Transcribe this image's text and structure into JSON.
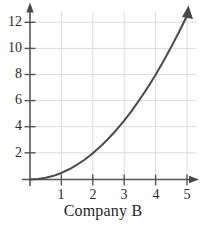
{
  "figure": {
    "caption": "Company B",
    "background_color": "#ffffff"
  },
  "chart_data": {
    "type": "line",
    "title": "",
    "subtitle": "",
    "xlabel": "Company B",
    "ylabel": "",
    "xlim": [
      0,
      5.4
    ],
    "ylim": [
      0,
      13.0
    ],
    "grid": true,
    "legend": null,
    "curve_color": "#4a4a4a",
    "axis_color": "#555555",
    "grid_color": "#d9d9d9",
    "xticks": [
      1,
      2,
      3,
      4,
      5
    ],
    "xtick_labels": [
      "1",
      "2",
      "3",
      "4",
      "5"
    ],
    "yticks": [
      2,
      4,
      6,
      8,
      10,
      12
    ],
    "ytick_labels": [
      "2",
      "4",
      "6",
      "8",
      "10",
      "12"
    ],
    "annotations": [
      "x-axis arrowhead at right end",
      "y-axis arrowhead at top end",
      "curve arrowhead at upper right end"
    ],
    "relationship": "y = 0.5 * x^2",
    "x": [
      0,
      0.25,
      0.5,
      0.75,
      1,
      1.25,
      1.5,
      1.75,
      2,
      2.25,
      2.5,
      2.75,
      3,
      3.25,
      3.5,
      3.75,
      4,
      4.25,
      4.5,
      4.75,
      5
    ],
    "series": [
      {
        "name": "Company B",
        "values": [
          0,
          0.03,
          0.13,
          0.28,
          0.5,
          0.78,
          1.13,
          1.53,
          2,
          2.53,
          3.13,
          3.78,
          4.5,
          5.28,
          6.13,
          7.03,
          8,
          9.03,
          10.13,
          11.28,
          12.5
        ]
      }
    ]
  }
}
